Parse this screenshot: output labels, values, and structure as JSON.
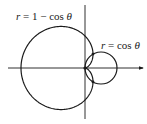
{
  "diagram": {
    "type": "polar-curves",
    "colors": {
      "stroke": "#1a1a1a",
      "background": "#ffffff"
    },
    "axes": {
      "x_axis": {
        "arrow": true
      },
      "y_axis": {
        "arrow": false
      }
    },
    "curves": [
      {
        "name": "cardioid",
        "equation": "r = 1 − cos θ",
        "label_parts": {
          "lhs": "r",
          "eq": " = 1 − cos ",
          "theta": "θ"
        }
      },
      {
        "name": "circle",
        "equation": "r = cos θ",
        "label_parts": {
          "lhs": "r",
          "eq": " = cos ",
          "theta": "θ"
        }
      }
    ],
    "intersection_points": [
      {
        "theta": "π/3",
        "r": "1/2"
      },
      {
        "theta": "−π/3",
        "r": "1/2"
      },
      {
        "theta": "pole",
        "r": "0"
      }
    ]
  }
}
